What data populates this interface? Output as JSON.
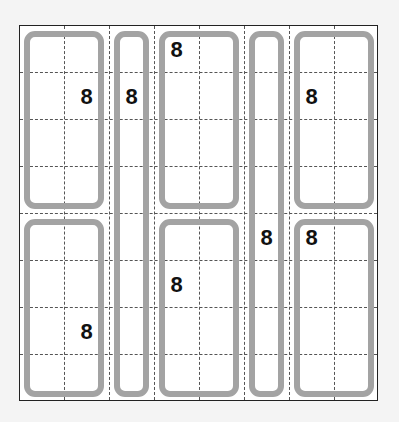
{
  "puzzle": {
    "type": "cage-grid",
    "columns": 8,
    "rows": 8,
    "colors": {
      "background": "#f4f4f4",
      "board": "#ffffff",
      "border": "#222222",
      "gridline": "#555555",
      "cage_outline": "#a3a3a3",
      "clue_text": "#111111"
    },
    "cages": [
      {
        "id": "cage-1",
        "col": 0,
        "row": 0,
        "width": 2,
        "height": 4
      },
      {
        "id": "cage-2",
        "col": 2,
        "row": 0,
        "width": 1,
        "height": 8
      },
      {
        "id": "cage-3",
        "col": 3,
        "row": 0,
        "width": 2,
        "height": 4
      },
      {
        "id": "cage-4",
        "col": 5,
        "row": 0,
        "width": 1,
        "height": 8
      },
      {
        "id": "cage-5",
        "col": 6,
        "row": 0,
        "width": 2,
        "height": 4
      },
      {
        "id": "cage-6",
        "col": 0,
        "row": 4,
        "width": 2,
        "height": 4
      },
      {
        "id": "cage-7",
        "col": 3,
        "row": 4,
        "width": 2,
        "height": 4
      },
      {
        "id": "cage-8",
        "col": 6,
        "row": 4,
        "width": 2,
        "height": 4
      }
    ],
    "clues": [
      {
        "col": 1,
        "row": 1,
        "value": "8"
      },
      {
        "col": 2,
        "row": 1,
        "value": "8"
      },
      {
        "col": 3,
        "row": 0,
        "value": "8"
      },
      {
        "col": 6,
        "row": 1,
        "value": "8"
      },
      {
        "col": 5,
        "row": 4,
        "value": "8"
      },
      {
        "col": 6,
        "row": 4,
        "value": "8"
      },
      {
        "col": 3,
        "row": 5,
        "value": "8"
      },
      {
        "col": 1,
        "row": 6,
        "value": "8"
      }
    ]
  }
}
